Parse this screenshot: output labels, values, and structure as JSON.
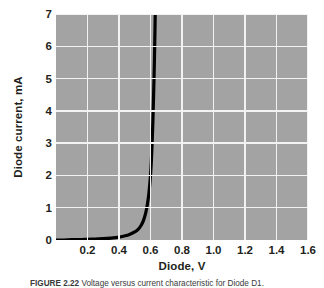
{
  "figure": {
    "caption_label": "FIGURE 2.22",
    "caption_text": "Voltage versus current characteristic for Diode D1.",
    "background_color": "#ffffff"
  },
  "axes": {
    "x_title": "Diode, V",
    "y_title": "Diode current, mA",
    "x_tick_labels": [
      "0.2",
      "0.4",
      "0.6",
      "0.8",
      "1.0",
      "1.2",
      "1.4",
      "1.6"
    ],
    "y_tick_labels": [
      "7",
      "6",
      "5",
      "4",
      "3",
      "2",
      "1",
      "0"
    ],
    "plot_background_color": "#a3a3a3",
    "gridline_color": "#f2f2f2",
    "curve_color": "#000000"
  },
  "chart_data": {
    "type": "line",
    "title": "",
    "xlabel": "Diode, V",
    "ylabel": "Diode current, mA",
    "xlim": [
      0,
      1.6
    ],
    "ylim": [
      0,
      7
    ],
    "xticks": [
      0.2,
      0.4,
      0.6,
      0.8,
      1.0,
      1.2,
      1.4,
      1.6
    ],
    "yticks": [
      0,
      1,
      2,
      3,
      4,
      5,
      6,
      7
    ],
    "grid": true,
    "legend": "none",
    "series": [
      {
        "name": "Diode D1 I-V characteristic",
        "x": [
          0.0,
          0.05,
          0.1,
          0.15,
          0.2,
          0.25,
          0.3,
          0.35,
          0.4,
          0.44,
          0.47,
          0.5,
          0.52,
          0.54,
          0.555,
          0.57,
          0.58,
          0.59,
          0.6,
          0.605,
          0.61,
          0.615,
          0.62,
          0.625,
          0.628,
          0.63
        ],
        "y": [
          0.0,
          0.0,
          0.01,
          0.01,
          0.02,
          0.03,
          0.04,
          0.06,
          0.09,
          0.13,
          0.18,
          0.25,
          0.32,
          0.45,
          0.6,
          0.85,
          1.1,
          1.45,
          2.0,
          2.4,
          2.95,
          3.65,
          4.55,
          5.6,
          6.4,
          7.0
        ]
      }
    ]
  }
}
